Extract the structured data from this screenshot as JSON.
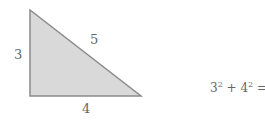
{
  "diagram": {
    "triangle": {
      "fill": "#d9d9d9",
      "stroke": "#8c8c8c",
      "vertices": [
        [
          30,
          10
        ],
        [
          30,
          96
        ],
        [
          141,
          96
        ]
      ]
    },
    "labels": {
      "side_a": "3",
      "side_b": "4",
      "hypotenuse": "5"
    },
    "equation": {
      "a": "3",
      "a_exp": "2",
      "plus": "+",
      "b": "4",
      "b_exp": "2",
      "equals": "=",
      "c": "5",
      "c_exp": "2"
    }
  }
}
